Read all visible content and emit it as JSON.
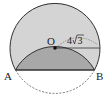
{
  "diagram": {
    "type": "geometry",
    "labels": {
      "center": "O",
      "point_a": "A",
      "point_b": "B",
      "radius": "4√3",
      "radius_coef": "4",
      "radius_root": "3"
    },
    "colors": {
      "circle_fill": "#d4d4d4",
      "segment_fill": "#a8a8a8",
      "stroke": "#333333"
    }
  }
}
